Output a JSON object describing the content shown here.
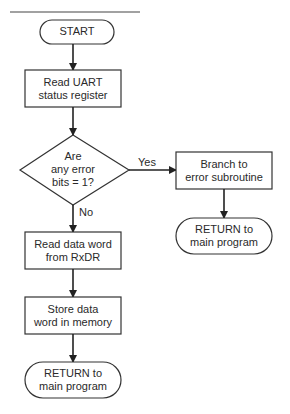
{
  "diagram": {
    "type": "flowchart",
    "nodes": [
      {
        "id": "start",
        "shape": "terminator",
        "lines": [
          "START"
        ]
      },
      {
        "id": "read_status",
        "shape": "process",
        "lines": [
          "Read UART",
          "status register"
        ]
      },
      {
        "id": "decision",
        "shape": "decision",
        "lines": [
          "Are",
          "any error",
          "bits = 1?"
        ]
      },
      {
        "id": "branch",
        "shape": "process",
        "lines": [
          "Branch to",
          "error subroutine"
        ]
      },
      {
        "id": "return_err",
        "shape": "terminator",
        "lines": [
          "RETURN to",
          "main program"
        ]
      },
      {
        "id": "read_data",
        "shape": "process",
        "lines": [
          "Read data word",
          "from RxDR"
        ]
      },
      {
        "id": "store",
        "shape": "process",
        "lines": [
          "Store data",
          "word in memory"
        ]
      },
      {
        "id": "return_main",
        "shape": "terminator",
        "lines": [
          "RETURN to",
          "main program"
        ]
      }
    ],
    "edges": [
      {
        "from": "start",
        "to": "read_status",
        "label": ""
      },
      {
        "from": "read_status",
        "to": "decision",
        "label": ""
      },
      {
        "from": "decision",
        "to": "branch",
        "label": "Yes"
      },
      {
        "from": "decision",
        "to": "read_data",
        "label": "No"
      },
      {
        "from": "branch",
        "to": "return_err",
        "label": ""
      },
      {
        "from": "read_data",
        "to": "store",
        "label": ""
      },
      {
        "from": "store",
        "to": "return_main",
        "label": ""
      }
    ]
  }
}
